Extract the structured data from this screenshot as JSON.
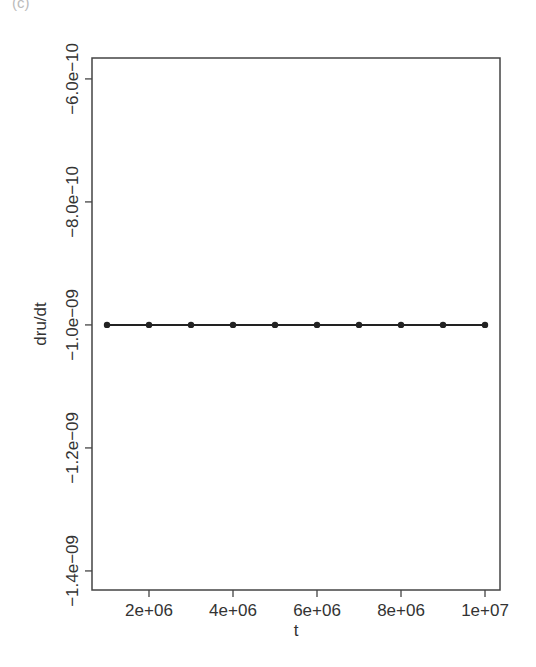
{
  "panel_label": "(c)",
  "chart_data": {
    "type": "line",
    "title": "",
    "xlabel": "t",
    "ylabel": "dru/dt",
    "x": [
      1000000,
      2000000,
      3000000,
      4000000,
      5000000,
      6000000,
      7000000,
      8000000,
      9000000,
      10000000
    ],
    "series": [
      {
        "name": "dru/dt",
        "values": [
          -1e-09,
          -1e-09,
          -1e-09,
          -1e-09,
          -1e-09,
          -1e-09,
          -1e-09,
          -1e-09,
          -1e-09,
          -1e-09
        ],
        "color": "#222222",
        "marker": "circle"
      }
    ],
    "xlim": [
      643000,
      10357000
    ],
    "ylim": [
      -1.431e-09,
      -5.66e-10
    ],
    "x_ticks": [
      2000000,
      4000000,
      6000000,
      8000000,
      10000000
    ],
    "x_tick_labels": [
      "2e+06",
      "4e+06",
      "6e+06",
      "8e+06",
      "1e+07"
    ],
    "y_ticks": [
      -6e-10,
      -8e-10,
      -1e-09,
      -1.2e-09,
      -1.4e-09
    ],
    "y_tick_labels": [
      "-6.0e-10",
      "-8.0e-10",
      "-1.0e-09",
      "-1.2e-09",
      "-1.4e-09"
    ],
    "grid": false,
    "legend": null
  }
}
